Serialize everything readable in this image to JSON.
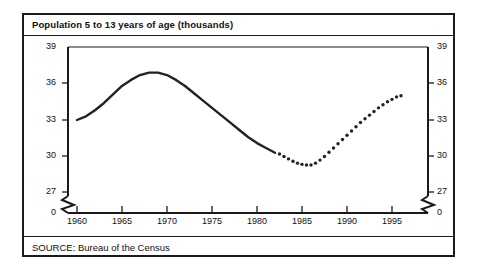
{
  "chart_data": {
    "type": "line",
    "title": "Population 5 to 13 years of age (thousands)",
    "source": "SOURCE: Bureau of the Census",
    "xlabel": "",
    "ylabel": "",
    "xlim": [
      1959,
      1996.5
    ],
    "ylim": [
      26.2,
      39
    ],
    "axis_break": true,
    "grid": false,
    "legend": "none",
    "y_ticks": [
      39,
      36,
      33,
      30,
      27,
      0
    ],
    "y_tick_labels": [
      "39",
      "36",
      "33",
      "30",
      "27",
      "0"
    ],
    "x_ticks": [
      1960,
      1965,
      1970,
      1975,
      1980,
      1985,
      1990,
      1995
    ],
    "x_tick_labels": [
      "1960",
      "1965",
      "1970",
      "1975",
      "1980",
      "1985",
      "1990",
      "1995"
    ],
    "series": [
      {
        "name": "Actual",
        "style": "solid",
        "x": [
          1960,
          1961,
          1962,
          1963,
          1964,
          1965,
          1966,
          1967,
          1968,
          1969,
          1970,
          1971,
          1972,
          1973,
          1974,
          1975,
          1976,
          1977,
          1978,
          1979,
          1980,
          1981,
          1982
        ],
        "values": [
          33.0,
          33.3,
          33.8,
          34.4,
          35.1,
          35.8,
          36.3,
          36.7,
          36.9,
          36.9,
          36.7,
          36.3,
          35.8,
          35.2,
          34.6,
          34.0,
          33.4,
          32.8,
          32.2,
          31.6,
          31.1,
          30.7,
          30.3
        ]
      },
      {
        "name": "Projected",
        "style": "dotted",
        "x": [
          1982.5,
          1983,
          1983.5,
          1984,
          1984.5,
          1985,
          1985.5,
          1986,
          1986.5,
          1987,
          1987.5,
          1988,
          1988.5,
          1989,
          1989.5,
          1990,
          1990.5,
          1991,
          1991.5,
          1992,
          1992.5,
          1993,
          1993.5,
          1994,
          1994.5,
          1995,
          1995.5,
          1996
        ],
        "values": [
          30.2,
          30.0,
          29.8,
          29.6,
          29.45,
          29.35,
          29.3,
          29.3,
          29.45,
          29.7,
          30.0,
          30.35,
          30.7,
          31.05,
          31.4,
          31.75,
          32.1,
          32.45,
          32.8,
          33.1,
          33.4,
          33.7,
          34.0,
          34.25,
          34.5,
          34.7,
          34.9,
          35.0
        ]
      }
    ]
  }
}
